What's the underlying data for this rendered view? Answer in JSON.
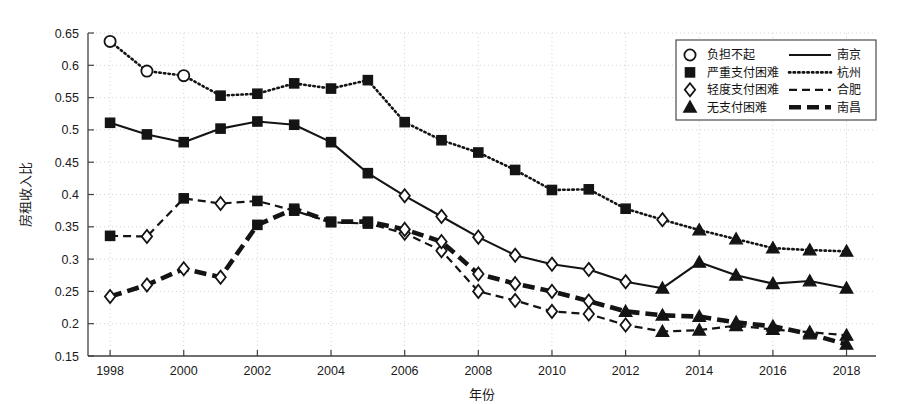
{
  "chart_data": {
    "type": "line",
    "title": "",
    "xlabel": "年份",
    "ylabel": "房租收入比",
    "xlim": [
      1997.4,
      2018.8
    ],
    "ylim": [
      0.15,
      0.65
    ],
    "ytick_step": 0.05,
    "grid": true,
    "grid_style": "dotted",
    "legend_position": "top-right",
    "x": [
      1998,
      1999,
      2000,
      2001,
      2002,
      2003,
      2004,
      2005,
      2006,
      2007,
      2008,
      2009,
      2010,
      2011,
      2012,
      2013,
      2014,
      2015,
      2016,
      2017,
      2018
    ],
    "xticks": [
      1998,
      2000,
      2002,
      2004,
      2006,
      2008,
      2010,
      2012,
      2014,
      2016,
      2018
    ],
    "yticks": [
      "0.15",
      "0.2",
      "0.25",
      "0.3",
      "0.35",
      "0.4",
      "0.45",
      "0.5",
      "0.55",
      "0.6",
      "0.65"
    ],
    "marker_legend": [
      {
        "marker": "circle",
        "label": "负担不起"
      },
      {
        "marker": "square",
        "label": "严重支付困难"
      },
      {
        "marker": "diamond",
        "label": "轻度支付困难"
      },
      {
        "marker": "triangle",
        "label": "无支付困难"
      }
    ],
    "line_legend": [
      {
        "style": "solid",
        "label": "南京"
      },
      {
        "style": "dotted",
        "label": "杭州"
      },
      {
        "style": "dashed",
        "label": "合肥"
      },
      {
        "style": "thick-dashed",
        "label": "南昌"
      }
    ],
    "series": [
      {
        "name": "南京",
        "style": "solid",
        "values": [
          0.511,
          0.493,
          0.481,
          0.502,
          0.513,
          0.508,
          0.481,
          0.433,
          0.398,
          0.366,
          0.334,
          0.306,
          0.292,
          0.284,
          0.265,
          0.255,
          0.295,
          0.275,
          0.262,
          0.266,
          0.255
        ],
        "markers": [
          "square",
          "square",
          "square",
          "square",
          "square",
          "square",
          "square",
          "square",
          "diamond",
          "diamond",
          "diamond",
          "diamond",
          "diamond",
          "diamond",
          "diamond",
          "triangle",
          "triangle",
          "triangle",
          "triangle",
          "triangle",
          "triangle"
        ]
      },
      {
        "name": "杭州",
        "style": "dotted",
        "values": [
          0.637,
          0.591,
          0.584,
          0.553,
          0.556,
          0.572,
          0.564,
          0.577,
          0.512,
          0.484,
          0.465,
          0.438,
          0.407,
          0.408,
          0.378,
          0.361,
          0.345,
          0.331,
          0.317,
          0.314,
          0.312
        ],
        "markers": [
          "circle",
          "circle",
          "circle",
          "square",
          "square",
          "square",
          "square",
          "square",
          "square",
          "square",
          "square",
          "square",
          "square",
          "square",
          "square",
          "diamond",
          "triangle",
          "triangle",
          "triangle",
          "triangle",
          "triangle"
        ]
      },
      {
        "name": "合肥",
        "style": "dashed",
        "values": [
          0.336,
          0.335,
          0.394,
          0.386,
          0.39,
          0.375,
          0.357,
          0.355,
          0.34,
          0.313,
          0.25,
          0.236,
          0.219,
          0.215,
          0.198,
          0.188,
          0.19,
          0.197,
          0.191,
          0.187,
          0.182
        ],
        "markers": [
          "square",
          "diamond",
          "square",
          "diamond",
          "square",
          "square",
          "square",
          "square",
          "diamond",
          "diamond",
          "diamond",
          "diamond",
          "diamond",
          "diamond",
          "diamond",
          "triangle",
          "triangle",
          "triangle",
          "triangle",
          "triangle",
          "triangle"
        ]
      },
      {
        "name": "南昌",
        "style": "thick-dashed",
        "values": [
          0.242,
          0.26,
          0.285,
          0.272,
          0.353,
          0.378,
          0.358,
          0.358,
          0.346,
          0.327,
          0.277,
          0.262,
          0.25,
          0.235,
          0.219,
          0.213,
          0.211,
          0.202,
          0.196,
          0.184,
          0.168
        ],
        "markers": [
          "diamond",
          "diamond",
          "diamond",
          "diamond",
          "square",
          "square",
          "square",
          "square",
          "diamond",
          "diamond",
          "diamond",
          "diamond",
          "diamond",
          "diamond",
          "triangle",
          "triangle",
          "triangle",
          "triangle",
          "triangle",
          "triangle",
          "triangle"
        ]
      }
    ]
  },
  "colors": {
    "line": "#141414",
    "grid": "#c8c8c8",
    "axis": "#404040",
    "text": "#161616",
    "background": "#ffffff"
  }
}
